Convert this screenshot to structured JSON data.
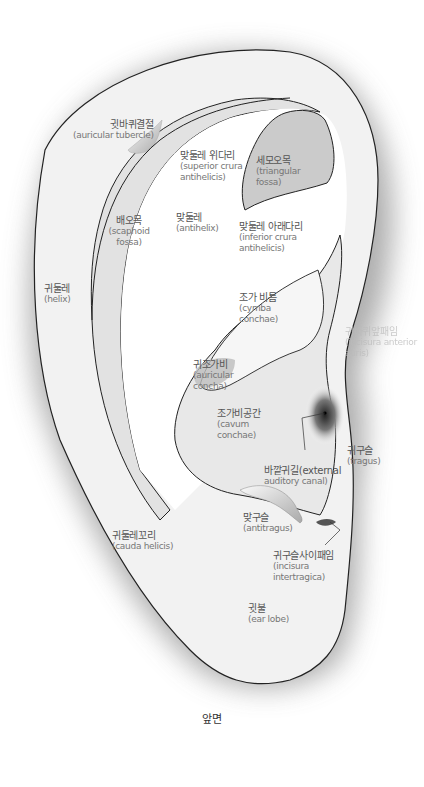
{
  "diagram": {
    "title": "앞면",
    "colors": {
      "skin": "#f3f3f3",
      "fossa_light": "#e4e4e4",
      "fossa_dark": "#c9c9c9",
      "outline": "#222222",
      "shadow": "#8a8a8a",
      "text": "#666666"
    },
    "labels": [
      {
        "id": "auricular-tubercle",
        "ko": "귓바퀴결절",
        "en": "(auricular tubercle)"
      },
      {
        "id": "superior-crura-antihelicis",
        "ko": "맞둘레 위다리",
        "en": "(superior crura antihelicis)"
      },
      {
        "id": "triangular-fossa",
        "ko": "세모오목",
        "en": "(triangular fossa)"
      },
      {
        "id": "scaphoid-fossa",
        "ko": "배오목",
        "en": "(scaphoid fossa)"
      },
      {
        "id": "antihelix",
        "ko": "맞둘레",
        "en": "(antihelix)"
      },
      {
        "id": "inferior-crura-antihelicis",
        "ko": "맞둘레 아래다리",
        "en": "(inferior crura antihelicis)"
      },
      {
        "id": "helix",
        "ko": "귀둘레",
        "en": "(helix)"
      },
      {
        "id": "cymba-conchae",
        "ko": "조가 비틈",
        "en": "(cymba conchae)"
      },
      {
        "id": "incisura-anterior-auris",
        "ko": "귀바퀴앞패임",
        "en": "(incisura anterior auris)"
      },
      {
        "id": "auricular-concha",
        "ko": "귀조가비",
        "en": "(auricular concha)"
      },
      {
        "id": "cavum-conchae",
        "ko": "조가비공간",
        "en": "(cavum conchae)"
      },
      {
        "id": "tragus",
        "ko": "귀구슬",
        "en": "(tragus)"
      },
      {
        "id": "external-auditory-canal",
        "ko": "바깥귀길(external",
        "en": "auditory canal)"
      },
      {
        "id": "antitragus",
        "ko": "맞구슬",
        "en": "(antitragus)"
      },
      {
        "id": "cauda-helicis",
        "ko": "귀둘레꼬리",
        "en": "(cauda helicis)"
      },
      {
        "id": "incisura-intertragica",
        "ko": "귀구슬사이패임",
        "en": "(incisura intertragica)"
      },
      {
        "id": "ear-lobe",
        "ko": "귓불",
        "en": "(ear lobe)"
      }
    ]
  }
}
